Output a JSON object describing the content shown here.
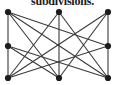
{
  "figure": {
    "caption": "subdivisions.",
    "background_color": "#ffffff",
    "ink_color": "#262626",
    "width": 125,
    "height": 85
  },
  "graph": {
    "type": "undirected-graph-drawing",
    "vertex_radius": 3.1,
    "edge_width": 1.1,
    "vertex_color": "#1c1c1c",
    "edge_color": "#3a3a3a",
    "vertices": [
      {
        "id": "tl",
        "label": "top-left",
        "x": 8,
        "y": 12
      },
      {
        "id": "tm",
        "label": "top-middle",
        "x": 59,
        "y": 12
      },
      {
        "id": "tr",
        "label": "top-right",
        "x": 108,
        "y": 12
      },
      {
        "id": "ml",
        "label": "middle-left",
        "x": 8,
        "y": 46
      },
      {
        "id": "mr",
        "label": "middle-right",
        "x": 108,
        "y": 46
      },
      {
        "id": "bl",
        "label": "bottom-left",
        "x": 8,
        "y": 78
      },
      {
        "id": "bm",
        "label": "bottom-middle",
        "x": 59,
        "y": 78
      },
      {
        "id": "br",
        "label": "bottom-right",
        "x": 108,
        "y": 78
      }
    ],
    "edges": [
      {
        "from": "tl",
        "to": "ml"
      },
      {
        "from": "ml",
        "to": "bl"
      },
      {
        "from": "tr",
        "to": "mr"
      },
      {
        "from": "mr",
        "to": "br"
      },
      {
        "from": "tm",
        "to": "bm"
      },
      {
        "from": "tl",
        "to": "bm"
      },
      {
        "from": "tl",
        "to": "br"
      },
      {
        "from": "tl",
        "to": "mr"
      },
      {
        "from": "tm",
        "to": "bl"
      },
      {
        "from": "tm",
        "to": "br"
      },
      {
        "from": "tr",
        "to": "bl"
      },
      {
        "from": "tr",
        "to": "bm"
      },
      {
        "from": "ml",
        "to": "br"
      },
      {
        "from": "ml",
        "to": "bm"
      },
      {
        "from": "mr",
        "to": "bl"
      }
    ]
  }
}
